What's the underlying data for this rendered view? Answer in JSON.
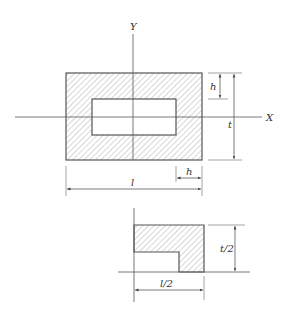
{
  "diagram": {
    "axes": {
      "y_label": "Y",
      "x_label": "X"
    },
    "full_section": {
      "dim_h_vertical": "h",
      "dim_t": "t",
      "dim_h_horizontal": "h",
      "dim_l": "l"
    },
    "quarter_section": {
      "dim_t_half": "t/2",
      "dim_l_half": "l/2"
    },
    "colors": {
      "line": "#555555",
      "hatch": "#9a9a9a",
      "text": "#333333"
    }
  }
}
